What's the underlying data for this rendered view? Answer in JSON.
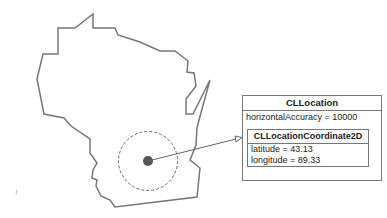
{
  "diagram": {
    "cllocation": {
      "title": "CLLocation",
      "attributes": [
        "horizontalAccuracy = 10000"
      ]
    },
    "coordinate": {
      "title": "CLLocationCoordinate2D",
      "attributes": [
        "latitude = 43.13",
        "longitude = 89.33"
      ]
    },
    "colors": {
      "outline": "#777777",
      "dot": "#555555",
      "text": "#222222"
    }
  }
}
